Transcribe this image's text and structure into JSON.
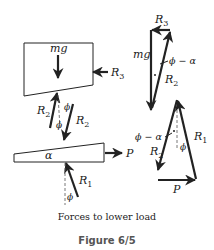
{
  "diagram": {
    "load_block": {
      "weight_label": "mg",
      "side_force_label": "R",
      "side_force_sub": "3"
    },
    "interface_forces": {
      "left_label": "R",
      "left_sub": "2",
      "right_label": "R",
      "right_sub": "2",
      "angle_upper": "ϕ",
      "angle_lower": "ϕ"
    },
    "wedge": {
      "angle_label": "α",
      "push_force_label": "P",
      "reaction_label": "R",
      "reaction_sub": "1",
      "reaction_angle": "ϕ"
    },
    "upper_triangle": {
      "top_label": "R",
      "top_sub": "3",
      "left_label": "mg",
      "angle_label": "ϕ − α",
      "hyp_label": "R",
      "hyp_sub": "2"
    },
    "lower_triangle": {
      "angle_label": "ϕ − α",
      "left_label": "R",
      "left_sub": "2",
      "right_label": "R",
      "right_sub": "1",
      "inner_angle": "ϕ",
      "bottom_label": "P"
    },
    "caption": "Forces to lower load",
    "figure_label": "Figure 6/5"
  },
  "colors": {
    "ink": "#222222",
    "figure_label": "#555555",
    "background": "#ffffff"
  }
}
